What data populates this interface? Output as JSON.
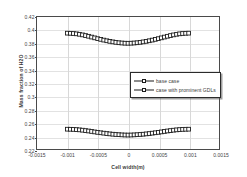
{
  "chart_data": {
    "type": "line",
    "title": "",
    "xlabel": "Cell width(m)",
    "ylabel": "Mass fraction of H2O",
    "xlim": [
      -0.0015,
      0.0015
    ],
    "ylim": [
      0.22,
      0.42
    ],
    "grid": true,
    "legend_position": "center-right",
    "xticks": [
      "-0.0015",
      "-0.001",
      "-0.0005",
      "0",
      "0.0005",
      "0.001",
      "0.0015"
    ],
    "xtick_values": [
      -0.0015,
      -0.001,
      -0.0005,
      0,
      0.0005,
      0.001,
      0.0015
    ],
    "yticks": [
      "0.42",
      "0.4",
      "0.38",
      "0.36",
      "0.34",
      "0.32",
      "0.3",
      "0.28",
      "0.26",
      "0.24",
      "0.22"
    ],
    "ytick_values": [
      0.42,
      0.4,
      0.38,
      0.36,
      0.34,
      0.32,
      0.3,
      0.28,
      0.26,
      0.24,
      0.22
    ],
    "x": [
      -0.001,
      -0.00095,
      -0.0009,
      -0.00085,
      -0.0008,
      -0.00075,
      -0.0007,
      -0.00065,
      -0.0006,
      -0.00055,
      -0.0005,
      -0.00045,
      -0.0004,
      -0.00035,
      -0.0003,
      -0.00025,
      -0.0002,
      -0.00015,
      -0.0001,
      -5e-05,
      0,
      5e-05,
      0.0001,
      0.00015,
      0.0002,
      0.00025,
      0.0003,
      0.00035,
      0.0004,
      0.00045,
      0.0005,
      0.00055,
      0.0006,
      0.00065,
      0.0007,
      0.00075,
      0.0008,
      0.00085,
      0.0009,
      0.00095,
      0.001
    ],
    "series": [
      {
        "name": "base case",
        "marker": "square",
        "values": [
          0.3955,
          0.3953,
          0.395,
          0.3945,
          0.3938,
          0.3929,
          0.3919,
          0.3908,
          0.3896,
          0.3884,
          0.3872,
          0.3861,
          0.385,
          0.384,
          0.3831,
          0.3823,
          0.3816,
          0.381,
          0.3806,
          0.3803,
          0.3802,
          0.3803,
          0.3806,
          0.381,
          0.3816,
          0.3823,
          0.3831,
          0.384,
          0.385,
          0.3861,
          0.3872,
          0.3884,
          0.3896,
          0.3908,
          0.3919,
          0.3929,
          0.3938,
          0.3945,
          0.395,
          0.3953,
          0.3955
        ]
      },
      {
        "name": "case with prominent GDLs",
        "marker": "square",
        "values": [
          0.25,
          0.2499,
          0.2497,
          0.2494,
          0.249,
          0.2485,
          0.2479,
          0.2473,
          0.2466,
          0.2459,
          0.2452,
          0.2446,
          0.244,
          0.2434,
          0.2429,
          0.2424,
          0.242,
          0.2417,
          0.2414,
          0.2412,
          0.2411,
          0.2412,
          0.2414,
          0.2417,
          0.242,
          0.2424,
          0.2429,
          0.2434,
          0.244,
          0.2446,
          0.2452,
          0.2459,
          0.2466,
          0.2473,
          0.2479,
          0.2485,
          0.249,
          0.2494,
          0.2497,
          0.2499,
          0.25
        ]
      }
    ],
    "colors": {
      "line": "#1a1a1a",
      "marker_face": "#ffffff",
      "marker_edge": "#1a1a1a",
      "grid": "#d8d8d8",
      "frame": "#4a4a4a"
    }
  }
}
